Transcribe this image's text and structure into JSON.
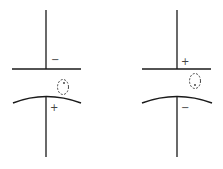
{
  "diagram": {
    "stroke_color": "#1a1a1a",
    "capacitors": [
      {
        "name": "left",
        "top_plate": "straight",
        "bottom_plate": "curved",
        "top_sign": "−",
        "bottom_sign": "+"
      },
      {
        "name": "right",
        "top_plate": "straight",
        "bottom_plate": "curved",
        "top_sign": "+",
        "bottom_sign": "−"
      }
    ]
  }
}
